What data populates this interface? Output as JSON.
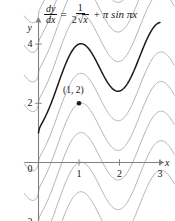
{
  "figure": {
    "equation": {
      "lhs_num": "dy",
      "lhs_den": "dx",
      "equals": "=",
      "rhs_num": "1",
      "rhs_den_coef": "2",
      "rhs_den_radicand": "x",
      "plus": "+",
      "trig_term": "π sin πx"
    },
    "axes": {
      "x_axis_label": "x",
      "y_axis_label": "y",
      "x_ticks": [
        "1",
        "2",
        "3"
      ],
      "y_ticks": [
        "6",
        "4",
        "2",
        "0",
        "−2"
      ],
      "x_tick_values": [
        1,
        2,
        3
      ],
      "y_tick_values": [
        6,
        4,
        2,
        0,
        -2
      ]
    },
    "annotation": {
      "point_label": "(1, 2)",
      "point_x": 1,
      "point_y": 2
    },
    "colors": {
      "solution_curve": "#1a1a1a",
      "family_curves": "#b3b3b3",
      "axis": "#808080",
      "text": "#141414"
    }
  },
  "chart_data": {
    "type": "line",
    "title": "",
    "xlabel": "x",
    "ylabel": "y",
    "xlim": [
      -0.35,
      3.35
    ],
    "ylim": [
      -2.9,
      7.2
    ],
    "grid": false,
    "legend": null,
    "xticks": [
      1,
      2,
      3
    ],
    "yticks": [
      -2,
      0,
      2,
      4,
      6
    ],
    "equation_text": "dy/dx = 1/(2√x) + π sin πx",
    "general_solution": "y = √x − cos(πx) + C",
    "particular_solution": "y = √x − cos(πx) + 2",
    "annotations": [
      {
        "text": "(1, 2)",
        "x": 1,
        "y": 2,
        "marker": "dot"
      }
    ],
    "series": [
      {
        "name": "particular solution C = 2",
        "style": "solid-dark",
        "C": 2,
        "x": [
          0,
          0.1,
          0.2,
          0.3,
          0.4,
          0.5,
          0.6,
          0.7,
          0.8,
          0.9,
          1.0,
          1.1,
          1.2,
          1.3,
          1.4,
          1.5,
          1.6,
          1.7,
          1.8,
          1.9,
          2.0,
          2.1,
          2.2,
          2.3,
          2.4,
          2.5,
          2.6,
          2.7,
          2.8,
          2.9,
          3.0
        ],
        "y": [
          -0.69,
          0.17,
          0.76,
          1.3,
          1.72,
          2.04,
          2.27,
          2.42,
          2.5,
          2.53,
          2.53,
          2.5,
          2.45,
          2.37,
          2.27,
          2.16,
          2.06,
          1.98,
          1.93,
          1.92,
          1.96,
          2.04,
          2.17,
          2.33,
          2.53,
          2.74,
          2.94,
          3.13,
          3.28,
          3.4,
          3.46
        ]
      },
      {
        "name": "family curve C = -3",
        "style": "solid-gray",
        "C": -3
      },
      {
        "name": "family curve C = -2",
        "style": "solid-gray",
        "C": -2
      },
      {
        "name": "family curve C = -1",
        "style": "solid-gray",
        "C": -1
      },
      {
        "name": "family curve C = 0",
        "style": "solid-gray",
        "C": 0
      },
      {
        "name": "family curve C = 1",
        "style": "solid-gray",
        "C": 1
      },
      {
        "name": "family curve C = 3",
        "style": "solid-gray",
        "C": 3
      },
      {
        "name": "family curve C = 4",
        "style": "solid-gray",
        "C": 4
      },
      {
        "name": "family curve C = 5",
        "style": "solid-gray",
        "C": 5
      },
      {
        "name": "family curve C = 6",
        "style": "solid-gray",
        "C": 6
      },
      {
        "name": "family curve C = 7",
        "style": "solid-gray",
        "C": 7
      }
    ]
  }
}
